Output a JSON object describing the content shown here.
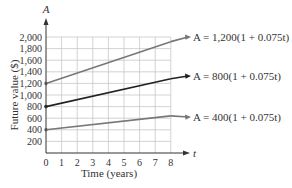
{
  "chart_data": {
    "type": "line",
    "title": "",
    "xlabel": "Time (years)",
    "ylabel": "Future value ($)",
    "x_axis_var": "t",
    "y_axis_var": "A",
    "xlim": [
      0,
      8
    ],
    "ylim": [
      0,
      2000
    ],
    "x_ticks": [
      "0",
      "1",
      "2",
      "3",
      "4",
      "5",
      "6",
      "7",
      "8"
    ],
    "y_ticks": [
      "200",
      "400",
      "600",
      "800",
      "1,000",
      "1,200",
      "1,400",
      "1,600",
      "1,800",
      "2,000"
    ],
    "grid": true,
    "legend": "annotations with arrows at right",
    "series": [
      {
        "name": "A = 1,200(1 + 0.075t)",
        "color": "#777777",
        "x": [
          0,
          8
        ],
        "values": [
          1200,
          1920
        ]
      },
      {
        "name": "A = 800(1 + 0.075t)",
        "color": "#222222",
        "x": [
          0,
          8
        ],
        "values": [
          800,
          1280
        ]
      },
      {
        "name": "A = 400(1 + 0.075t)",
        "color": "#777777",
        "x": [
          0,
          8
        ],
        "values": [
          400,
          640
        ]
      }
    ]
  }
}
